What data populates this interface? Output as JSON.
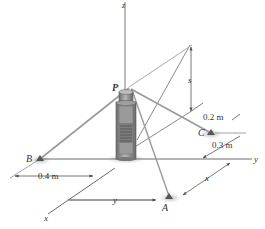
{
  "figure": {
    "type": "3d-statics-diagram",
    "axes": {
      "x": "x",
      "y": "y",
      "z": "z"
    },
    "points": {
      "P": "P",
      "A": "A",
      "B": "B",
      "C": "C"
    },
    "dimensions": {
      "s": "s",
      "ab_y": "y",
      "a_x": "x",
      "c_offset": "0.2 m",
      "c_to_y_axis": "0.3 m",
      "b_offset": "0.4 m"
    },
    "colors": {
      "line": "#7a7a7a",
      "cable": "#9a9a9a",
      "pole": "#8c8c8c",
      "shadow": "#bdbdbd",
      "text": "#333333"
    }
  }
}
